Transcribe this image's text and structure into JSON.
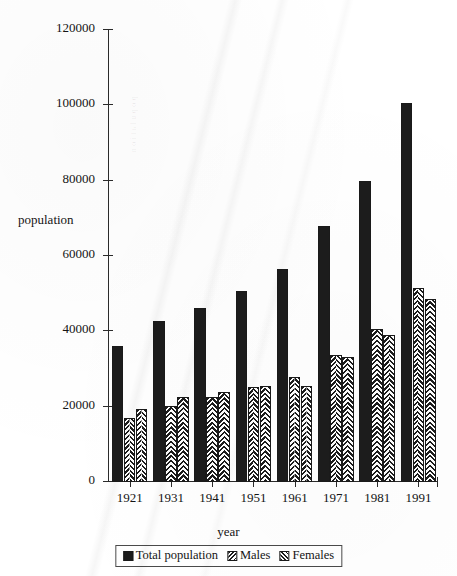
{
  "chart_data": {
    "type": "bar",
    "title": "",
    "xlabel": "year",
    "ylabel": "population",
    "categories": [
      "1921",
      "1931",
      "1941",
      "1951",
      "1961",
      "1971",
      "1981",
      "1991"
    ],
    "series": [
      {
        "name": "Total population",
        "pattern": "solid-black",
        "values": [
          36000,
          42800,
          46200,
          50700,
          56500,
          68000,
          80000,
          100500
        ]
      },
      {
        "name": "Males",
        "pattern": "herringbone-hatch",
        "values": [
          17000,
          20200,
          22500,
          25200,
          28000,
          33800,
          40500,
          51500
        ]
      },
      {
        "name": "Females",
        "pattern": "diagonal-hatch",
        "values": [
          19300,
          22700,
          24000,
          25500,
          25400,
          33300,
          39000,
          48500
        ]
      }
    ],
    "ylim": [
      0,
      120000
    ],
    "yticks": [
      0,
      20000,
      40000,
      60000,
      80000,
      100000,
      120000
    ],
    "ytick_labels": [
      "0",
      "20000",
      "40000",
      "60000",
      "80000",
      "100000",
      "120000"
    ],
    "grid": false,
    "legend_position": "bottom-center",
    "legend_entries": [
      "Total population",
      "Males",
      "Females"
    ],
    "colors": {
      "ink": "#1c1c1c",
      "axis": "#2b2b2b",
      "background": "#ffffff"
    }
  },
  "bleed_through_text": "population",
  "top_crop_text": ""
}
